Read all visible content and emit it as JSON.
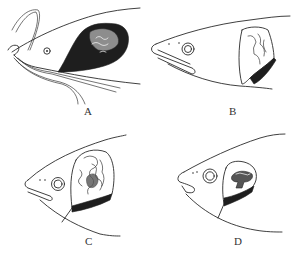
{
  "figure": {
    "panels": [
      {
        "id": "A",
        "label": "A",
        "subject": "fish-head-with-barbels-and-gill-mass"
      },
      {
        "id": "B",
        "label": "B",
        "subject": "fish-head-with-gill-mass"
      },
      {
        "id": "C",
        "label": "C",
        "subject": "fish-head-with-convoluted-gill-mass"
      },
      {
        "id": "D",
        "label": "D",
        "subject": "fish-head-with-small-gill-mass"
      }
    ],
    "colors": {
      "ink": "#1e1e1e",
      "background": "#ffffff"
    }
  }
}
